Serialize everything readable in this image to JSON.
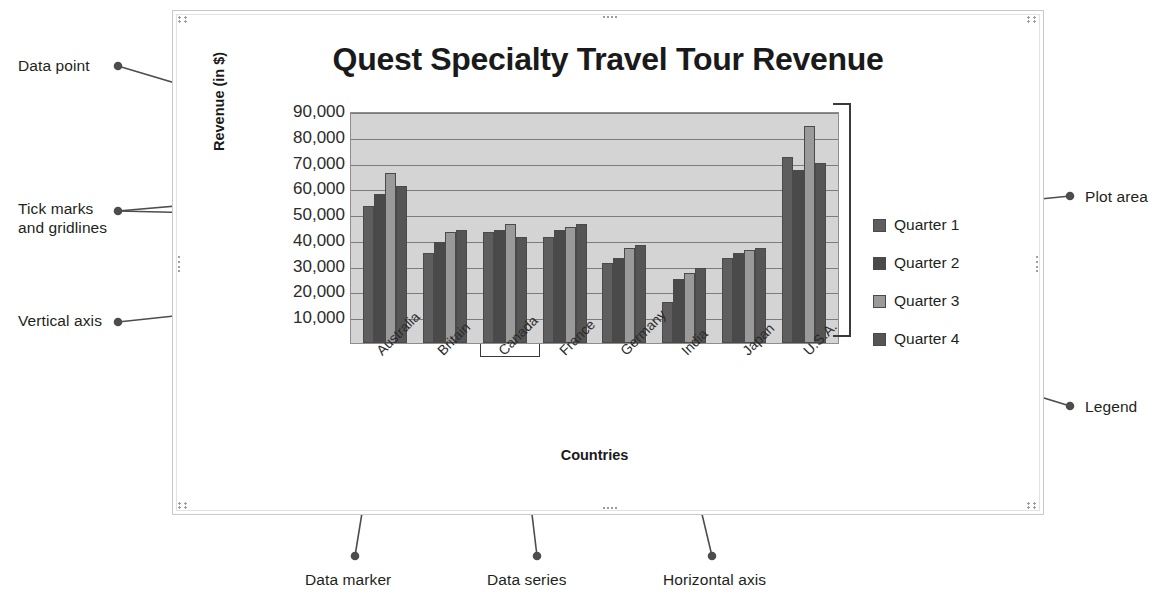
{
  "annotations": {
    "left": [
      {
        "id": "data-point",
        "label": "Data point"
      },
      {
        "id": "tick-marks-and-gridlines",
        "label": "Tick marks\nand gridlines"
      },
      {
        "id": "vertical-axis",
        "label": "Vertical axis"
      }
    ],
    "right": [
      {
        "id": "plot-area",
        "label": "Plot area"
      },
      {
        "id": "legend",
        "label": "Legend"
      }
    ],
    "bottom": [
      {
        "id": "data-marker",
        "label": "Data marker"
      },
      {
        "id": "data-series",
        "label": "Data series"
      },
      {
        "id": "horizontal-axis",
        "label": "Horizontal axis"
      }
    ]
  },
  "chart_data": {
    "type": "bar",
    "title": "Quest Specialty Travel Tour Revenue",
    "xlabel": "Countries",
    "ylabel": "Revenue (in $)",
    "ylim": [
      0,
      90000
    ],
    "ytick_labels": [
      "90,000",
      "80,000",
      "70,000",
      "60,000",
      "50,000",
      "40,000",
      "30,000",
      "20,000",
      "10,000"
    ],
    "ytick_values": [
      90000,
      80000,
      70000,
      60000,
      50000,
      40000,
      30000,
      20000,
      10000
    ],
    "grid": true,
    "legend_position": "right",
    "categories": [
      "Australia",
      "Britain",
      "Canada",
      "France",
      "Germany",
      "India",
      "Japan",
      "U.S.A."
    ],
    "series": [
      {
        "name": "Quarter 1",
        "color": "#5e5e5e",
        "values": [
          53000,
          35000,
          43000,
          41000,
          31000,
          16000,
          33000,
          72000
        ]
      },
      {
        "name": "Quarter 2",
        "color": "#4a4a4a",
        "values": [
          58000,
          39000,
          44000,
          44000,
          33000,
          25000,
          35000,
          67000
        ]
      },
      {
        "name": "Quarter 3",
        "color": "#9a9a9a",
        "values": [
          66000,
          43000,
          46000,
          45000,
          37000,
          27000,
          36000,
          84000
        ]
      },
      {
        "name": "Quarter 4",
        "color": "#555555",
        "values": [
          61000,
          44000,
          41000,
          46000,
          38000,
          29000,
          37000,
          70000
        ]
      }
    ],
    "plot_area_fill": "#d4d4d4",
    "gridline_color": "#7c7c7c"
  },
  "chart_object": {
    "selected": true,
    "handle_icon": "resize-handle-icon"
  }
}
